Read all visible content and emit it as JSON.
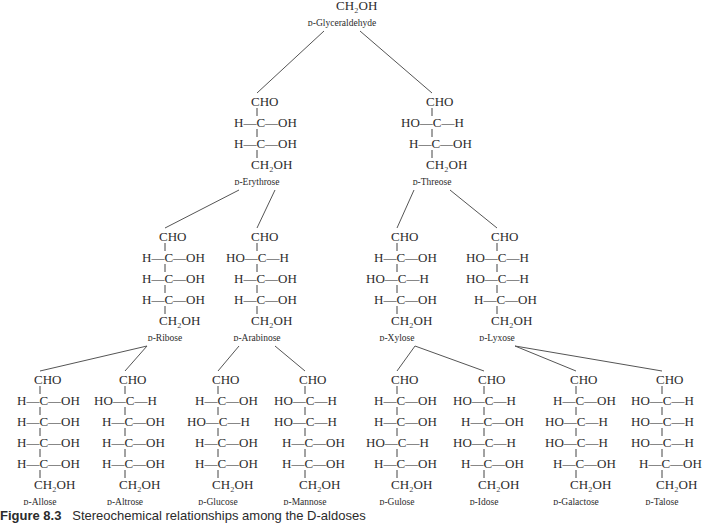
{
  "title": "Stereochemical relationships among the D-aldoses",
  "caption": {
    "label": "Figure 8.3",
    "text": "Stereochemical relationships among the D-aldoses"
  },
  "top_group": "CHO",
  "end_group": "CH₂OH",
  "molecules": [
    {
      "id": "glyceraldehyde",
      "name": "D-Glyceraldehyde",
      "level": 0,
      "parent": null,
      "config": [
        "R"
      ],
      "show_top": false
    },
    {
      "id": "erythrose",
      "name": "D-Erythrose",
      "level": 1,
      "parent": "glyceraldehyde",
      "config": [
        "R",
        "R"
      ]
    },
    {
      "id": "threose",
      "name": "D-Threose",
      "level": 1,
      "parent": "glyceraldehyde",
      "config": [
        "L",
        "R"
      ]
    },
    {
      "id": "ribose",
      "name": "D-Ribose",
      "level": 2,
      "parent": "erythrose",
      "config": [
        "R",
        "R",
        "R"
      ]
    },
    {
      "id": "arabinose",
      "name": "D-Arabinose",
      "level": 2,
      "parent": "erythrose",
      "config": [
        "L",
        "R",
        "R"
      ]
    },
    {
      "id": "xylose",
      "name": "D-Xylose",
      "level": 2,
      "parent": "threose",
      "config": [
        "R",
        "L",
        "R"
      ]
    },
    {
      "id": "lyxose",
      "name": "D-Lyxose",
      "level": 2,
      "parent": "threose",
      "config": [
        "L",
        "L",
        "R"
      ]
    },
    {
      "id": "allose",
      "name": "D-Allose",
      "level": 3,
      "parent": "ribose",
      "config": [
        "R",
        "R",
        "R",
        "R"
      ]
    },
    {
      "id": "altrose",
      "name": "D-Altrose",
      "level": 3,
      "parent": "ribose",
      "config": [
        "L",
        "R",
        "R",
        "R"
      ]
    },
    {
      "id": "glucose",
      "name": "D-Glucose",
      "level": 3,
      "parent": "arabinose",
      "config": [
        "R",
        "L",
        "R",
        "R"
      ]
    },
    {
      "id": "mannose",
      "name": "D-Mannose",
      "level": 3,
      "parent": "arabinose",
      "config": [
        "L",
        "L",
        "R",
        "R"
      ]
    },
    {
      "id": "gulose",
      "name": "D-Gulose",
      "level": 3,
      "parent": "xylose",
      "config": [
        "R",
        "R",
        "L",
        "R"
      ]
    },
    {
      "id": "idose",
      "name": "D-Idose",
      "level": 3,
      "parent": "xylose",
      "config": [
        "L",
        "R",
        "L",
        "R"
      ]
    },
    {
      "id": "galactose",
      "name": "D-Galactose",
      "level": 3,
      "parent": "lyxose",
      "config": [
        "R",
        "L",
        "L",
        "R"
      ]
    },
    {
      "id": "talose",
      "name": "D-Talose",
      "level": 3,
      "parent": "lyxose",
      "config": [
        "L",
        "L",
        "L",
        "R"
      ]
    }
  ],
  "legend": {
    "R": "H—C—OH",
    "L": "HO—C—H"
  }
}
